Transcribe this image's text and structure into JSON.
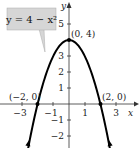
{
  "chart_data": {
    "type": "line",
    "title": "",
    "equation_label": "y = 4 − x²",
    "xlabel": "x",
    "ylabel": "y",
    "xlim": [
      -3.5,
      4
    ],
    "ylim": [
      -2.6,
      6.2
    ],
    "x_ticks": [
      -3,
      -1,
      1,
      3
    ],
    "x_tick_labels": [
      "−3",
      "−1",
      "1",
      "3"
    ],
    "y_ticks": [
      5,
      3,
      2,
      1,
      -1,
      -2
    ],
    "y_tick_labels": [
      "5",
      "3",
      "2",
      "1",
      "−1",
      "−2"
    ],
    "grid": false,
    "series": [
      {
        "name": "y = 4 − x²",
        "function": "4 - x^2",
        "x": [
          -2.5,
          -2,
          -1.5,
          -1,
          -0.5,
          0,
          0.5,
          1,
          1.5,
          2,
          2.5
        ],
        "y": [
          -2.25,
          0,
          1.75,
          3,
          3.75,
          4,
          3.75,
          3,
          1.75,
          0,
          -2.25
        ]
      }
    ],
    "annotations": [
      {
        "label": "(0, 4)",
        "x": 0,
        "y": 4
      },
      {
        "label": "(−2, 0)",
        "x": -2,
        "y": 0
      },
      {
        "label": "(2, 0)",
        "x": 2,
        "y": 0
      }
    ],
    "colors": {
      "curve": "#000000",
      "axis": "#333333",
      "label_box": "#d6d6d6"
    }
  }
}
